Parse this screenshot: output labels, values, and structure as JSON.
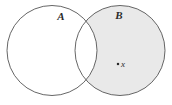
{
  "figure": {
    "kind": "venn-diagram",
    "background_color": "#ffffff",
    "width": 172,
    "height": 105
  },
  "sets": {
    "a": {
      "label": "A",
      "center_x": 52,
      "center_y": 50.5,
      "radius": 45,
      "fill_color": "#ffffff",
      "stroke_color": "#555555",
      "label_x": 61,
      "label_y": 20
    },
    "b": {
      "label": "B",
      "center_x": 120,
      "center_y": 50.5,
      "radius": 45,
      "fill_color": "#e9e9e9",
      "stroke_color": "#555555",
      "label_x": 119,
      "label_y": 19
    }
  },
  "shaded_region": {
    "description": "B minus A",
    "fill_color": "#e9e9e9"
  },
  "intersection": {
    "description": "A intersect B",
    "fill_color": "#ffffff"
  },
  "point": {
    "label": "x",
    "dot_x": 118,
    "dot_y": 64,
    "dot_size": 2.2,
    "dot_color": "#2b2b2b",
    "label_x": 123,
    "label_y": 67
  }
}
